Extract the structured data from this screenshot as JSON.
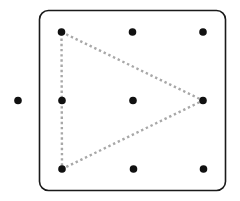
{
  "figure": {
    "frame": {
      "x": 39.5,
      "y": 10.5,
      "width": 186,
      "height": 180,
      "radius": 9,
      "stroke": "#1a1a1a",
      "stroke_width": 1.6
    },
    "dot_color": "#111111",
    "dot_radius": 3.8,
    "grid_dots": [
      {
        "id": "r1c1",
        "x": 61.5,
        "y": 32
      },
      {
        "id": "r1c2",
        "x": 132.5,
        "y": 32
      },
      {
        "id": "r1c3",
        "x": 203,
        "y": 32
      },
      {
        "id": "r2c1",
        "x": 62,
        "y": 100.5
      },
      {
        "id": "r2c2",
        "x": 133,
        "y": 100.5
      },
      {
        "id": "r2c3",
        "x": 203,
        "y": 100.5
      },
      {
        "id": "r3c1",
        "x": 62,
        "y": 169
      },
      {
        "id": "r3c2",
        "x": 133.5,
        "y": 169
      },
      {
        "id": "r3c3",
        "x": 203.5,
        "y": 169
      }
    ],
    "outside_dot": {
      "id": "outside-left",
      "x": 18,
      "y": 100.5
    },
    "triangle": {
      "vertices": [
        "r1c1",
        "r2c3",
        "r3c1"
      ],
      "stroke": "#a8a8a8",
      "stroke_width": 2.4,
      "dash": "2.4 2.8"
    }
  }
}
